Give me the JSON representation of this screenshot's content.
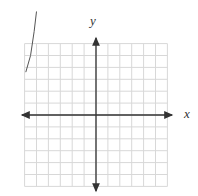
{
  "graph": {
    "x_label": "x",
    "y_label": "y",
    "grid": {
      "columns": 12,
      "rows": 12,
      "x_range": [
        -6,
        6
      ],
      "y_range": [
        -6,
        6
      ]
    },
    "colors": {
      "grid": "#d8d8d8",
      "axis": "#333333",
      "curve": "#555555"
    },
    "curve": {
      "description": "partial curve in upper-left region, extends above grid",
      "points": [
        [
          -5.0,
          8.7
        ],
        [
          -5.2,
          7.0
        ],
        [
          -5.5,
          5.0
        ],
        [
          -5.9,
          3.6
        ]
      ]
    }
  }
}
